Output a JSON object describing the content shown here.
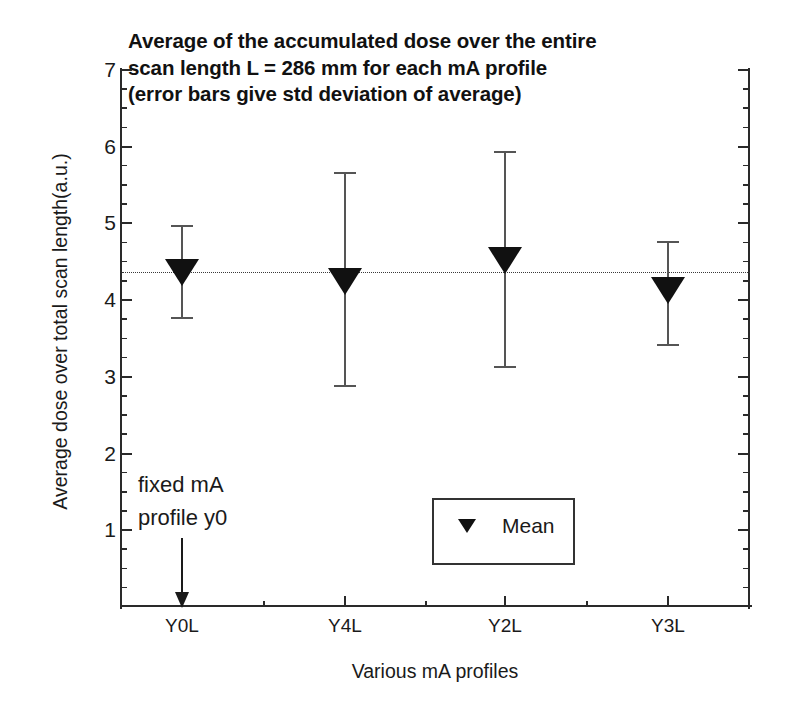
{
  "chart_data": {
    "type": "scatter",
    "title": "Average of the accumulated dose over the entire\nscan length L = 286 mm for each mA profile\n(error bars give std deviation of average)",
    "xlabel": "Various mA profiles",
    "ylabel": "Average dose over total scan length(a.u.)",
    "categories": [
      "Y0L",
      "Y4L",
      "Y2L",
      "Y3L"
    ],
    "values": [
      4.37,
      4.25,
      4.52,
      4.13
    ],
    "errors_upper": [
      4.97,
      5.66,
      5.93,
      4.76
    ],
    "errors_lower": [
      3.77,
      2.88,
      3.13,
      3.42
    ],
    "series": [
      {
        "name": "Mean",
        "marker": "triangle-down",
        "color": "#111111",
        "values": [
          4.37,
          4.25,
          4.52,
          4.13
        ]
      }
    ],
    "ylim": [
      0,
      7
    ],
    "ytick_labels": [
      "1",
      "2",
      "3",
      "4",
      "5",
      "6",
      "7"
    ],
    "ytick_values": [
      1,
      2,
      3,
      4,
      5,
      6,
      7
    ],
    "yminor_step": 0.25,
    "grid": false,
    "reference_line": {
      "value": 4.37,
      "style": "dotted",
      "color": "#3a3a3a"
    },
    "legend": {
      "position": "inside-center",
      "entries": [
        {
          "label": "Mean",
          "marker": "triangle-down"
        }
      ]
    },
    "annotations": [
      {
        "text": "fixed mA\nprofile y0",
        "target_category": "Y0L",
        "arrow": "down"
      }
    ]
  },
  "axes": {
    "y_tick_labels": [
      "7",
      "6",
      "5",
      "4",
      "3",
      "2",
      "1"
    ],
    "x_tick_labels": [
      "Y0L",
      "Y4L",
      "Y2L",
      "Y3L"
    ]
  },
  "legend": {
    "mean_label": "Mean"
  },
  "annotation": {
    "fixed_ma_text": "fixed mA\nprofile y0"
  }
}
